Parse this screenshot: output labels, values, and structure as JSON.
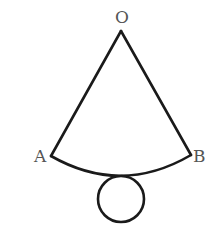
{
  "diagram": {
    "labels": {
      "apex": "O",
      "left": "A",
      "right": "B"
    },
    "stroke_color": "#1a1a1a",
    "label_color": "#555555",
    "shapes": [
      {
        "type": "sector",
        "apex": "O",
        "endpoints": [
          "A",
          "B"
        ]
      },
      {
        "type": "circle",
        "position": "below arc AB, tangent"
      }
    ]
  }
}
